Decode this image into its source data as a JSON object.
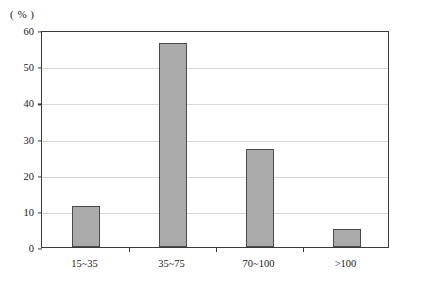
{
  "chart_data": {
    "type": "bar",
    "title": "",
    "xlabel": "",
    "ylabel": "( % )",
    "categories": [
      "15~35",
      "35~75",
      "70~100",
      ">100"
    ],
    "values": [
      11.3,
      56.4,
      27.2,
      5.1
    ],
    "ylim": [
      0,
      60
    ],
    "yticks": [
      0,
      10,
      20,
      30,
      40,
      50,
      60
    ],
    "ytick_labels": [
      "0",
      "10",
      "20",
      "30",
      "40",
      "50",
      "60"
    ],
    "grid": true,
    "legend": null,
    "series": [
      {
        "name": "",
        "values": [
          11.3,
          56.4,
          27.2,
          5.1
        ]
      }
    ]
  },
  "style": {
    "bar_fill": "#aaaaaa",
    "bar_border": "#4a4a4a",
    "grid_color": "#d8d8d8",
    "axis_color": "#3a3a3a",
    "background": "#ffffff"
  }
}
